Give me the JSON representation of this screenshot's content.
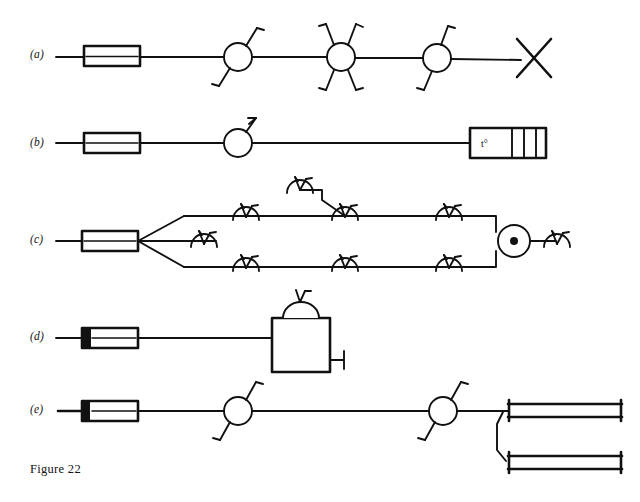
{
  "figure": {
    "caption": "Figure 22",
    "width": 640,
    "height": 502,
    "background_color": "#ffffff",
    "ink_color": "#111111",
    "style": "hand-drawn engineering line schematic, black ink on white paper"
  },
  "rows": [
    {
      "id": "a",
      "label": "(a)",
      "label_x": 30,
      "label_y": 48,
      "baseline_y": 57,
      "description": "Supply cylinder feeding a straight main with three circular sprinkler-head valves and an X end-of-line terminator",
      "components": [
        {
          "name": "supply-cylinder",
          "type": "cylinder",
          "x": 88,
          "y": 57
        },
        {
          "name": "circle-valve-2-arm",
          "type": "circle-node",
          "x": 238,
          "y": 57,
          "arms": 2
        },
        {
          "name": "circle-valve-4-arm",
          "type": "circle-node",
          "x": 341,
          "y": 57,
          "arms": 4
        },
        {
          "name": "circle-valve-2-arm",
          "type": "circle-node",
          "x": 437,
          "y": 57,
          "arms": 2
        },
        {
          "name": "x-terminator",
          "type": "cross-end",
          "x": 533,
          "y": 57
        }
      ]
    },
    {
      "id": "b",
      "label": "(b)",
      "label_x": 30,
      "label_y": 136,
      "baseline_y": 143,
      "description": "Supply cylinder feeding a main with one circular sprinkler-head valve terminating in a four-compartment temperature unit",
      "components": [
        {
          "name": "supply-cylinder",
          "type": "cylinder",
          "x": 88,
          "y": 143
        },
        {
          "name": "circle-valve-1-arm",
          "type": "circle-node",
          "x": 238,
          "y": 143,
          "arms": 1
        },
        {
          "name": "temperature-unit",
          "type": "segmented-box",
          "x": 476,
          "y": 143,
          "segments": 4,
          "label": "t°"
        }
      ]
    },
    {
      "id": "c",
      "label": "(c)",
      "label_x": 30,
      "label_y": 243,
      "baseline_y": 241,
      "description": "Supply cylinder branching into three parallel distribution mains fitted with sprinkler nozzles; the outer mains loop back into a circular junction with centre dot feeding a final nozzle",
      "components": [
        {
          "name": "supply-cylinder",
          "type": "cylinder",
          "x": 88,
          "y": 241
        },
        {
          "name": "branch-top-main",
          "type": "pipe-run",
          "y": 217
        },
        {
          "name": "branch-middle-stub",
          "type": "pipe-run",
          "y": 241
        },
        {
          "name": "branch-bottom-main",
          "type": "pipe-run",
          "y": 266
        },
        {
          "name": "raised-nozzle-riser",
          "type": "riser",
          "x": 300,
          "y": 186
        },
        {
          "name": "junction-circle-with-dot",
          "type": "circle-dot-node",
          "x": 514,
          "y": 241
        },
        {
          "name": "nozzle",
          "type": "sprinkler-nozzle",
          "count": 8
        }
      ]
    },
    {
      "id": "d",
      "label": "(d)",
      "label_x": 30,
      "label_y": 339,
      "baseline_y": 338,
      "description": "Supply cylinder feeding a square vessel with domed vent on top and a T-shaped drain outlet on the right",
      "components": [
        {
          "name": "supply-cylinder",
          "type": "cylinder",
          "x": 88,
          "y": 338
        },
        {
          "name": "square-tank",
          "type": "tank",
          "x": 272,
          "y": 320
        },
        {
          "name": "dome-vent",
          "type": "dome",
          "x": 300,
          "y": 310
        },
        {
          "name": "drain-outlet",
          "type": "tee-outlet",
          "x": 330,
          "y": 357
        }
      ]
    },
    {
      "id": "e",
      "label": "(e)",
      "label_x": 30,
      "label_y": 410,
      "baseline_y": 411,
      "description": "Supply cylinder feeding a main with two circular sprinkler-head valves ending in a pair of stacked capped distribution rails",
      "components": [
        {
          "name": "supply-cylinder",
          "type": "cylinder",
          "x": 88,
          "y": 411
        },
        {
          "name": "circle-valve-2-arm",
          "type": "circle-node",
          "x": 238,
          "y": 411,
          "arms": 2
        },
        {
          "name": "circle-valve-2-arm",
          "type": "circle-node",
          "x": 443,
          "y": 411,
          "arms": 2
        },
        {
          "name": "capped-rail-upper",
          "type": "rail",
          "x": 508,
          "y": 408
        },
        {
          "name": "capped-rail-lower",
          "type": "rail",
          "x": 508,
          "y": 461
        }
      ]
    }
  ]
}
